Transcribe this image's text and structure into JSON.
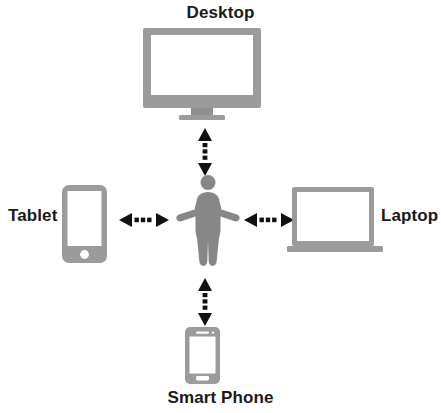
{
  "diagram": {
    "title_text": "",
    "type": "hub-and-spoke device connectivity diagram",
    "center": {
      "name": "user",
      "icon": "person-icon",
      "label": ""
    },
    "colors": {
      "device_gray": "#9b9b9b",
      "device_gray_dark": "#8d8d8d",
      "person_gray": "#878787",
      "screen_white": "#ffffff",
      "arrow_black": "#111111",
      "label_black": "#1a1a1a",
      "background": "#ffffff"
    },
    "nodes": [
      {
        "id": "desktop",
        "label": "Desktop",
        "icon": "desktop-monitor-icon",
        "position": "top",
        "label_position": "above"
      },
      {
        "id": "tablet",
        "label": "Tablet",
        "icon": "tablet-icon",
        "position": "left",
        "label_position": "left"
      },
      {
        "id": "laptop",
        "label": "Laptop",
        "icon": "laptop-icon",
        "position": "right",
        "label_position": "right"
      },
      {
        "id": "smartphone",
        "label": "Smart Phone",
        "icon": "smartphone-icon",
        "position": "bottom",
        "label_position": "below"
      }
    ],
    "connectors": [
      {
        "id": "connector-desktop",
        "from": "user",
        "to": "desktop",
        "style": "dotted",
        "heads": "both",
        "orientation": "vertical"
      },
      {
        "id": "connector-tablet",
        "from": "user",
        "to": "tablet",
        "style": "dotted",
        "heads": "both",
        "orientation": "horizontal"
      },
      {
        "id": "connector-laptop",
        "from": "user",
        "to": "laptop",
        "style": "dotted",
        "heads": "both",
        "orientation": "horizontal"
      },
      {
        "id": "connector-smartphone",
        "from": "user",
        "to": "smartphone",
        "style": "dotted",
        "heads": "both",
        "orientation": "vertical"
      }
    ]
  }
}
